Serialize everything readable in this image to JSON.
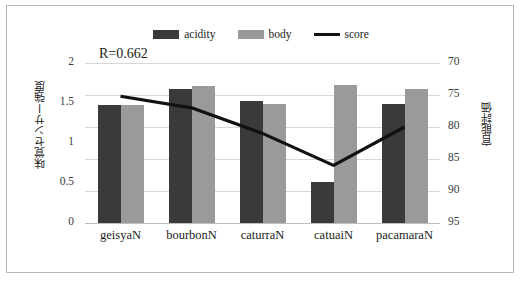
{
  "chart_data": {
    "type": "bar",
    "title": "",
    "categories": [
      "geisyaN",
      "bourbonN",
      "caturraN",
      "catuaiN",
      "pacamaraN"
    ],
    "series": [
      {
        "name": "acidity",
        "type": "bar",
        "axis": "left",
        "color": "#3a3a3a",
        "values": [
          1.48,
          1.67,
          1.53,
          0.51,
          1.49
        ]
      },
      {
        "name": "body",
        "type": "bar",
        "axis": "left",
        "color": "#9a9a9a",
        "values": [
          1.48,
          1.71,
          1.49,
          1.73,
          1.67
        ]
      },
      {
        "name": "score",
        "type": "line",
        "axis": "right",
        "color": "#111111",
        "values": [
          89.8,
          88.0,
          84.0,
          79.0,
          85.0
        ]
      }
    ],
    "xlabel": "",
    "ylabel": "味覚センサー強度",
    "y2label": "官能評価",
    "ylim": [
      0,
      2
    ],
    "y2lim": [
      70,
      95
    ],
    "yticks": [
      "0",
      "0.5",
      "1",
      "1.5",
      "2"
    ],
    "y2ticks": [
      "70",
      "75",
      "80",
      "85",
      "90",
      "95"
    ],
    "grid": true,
    "legend_position": "top-center",
    "annotations": [
      "R=0.662"
    ]
  },
  "legend": {
    "items": [
      {
        "label": "acidity",
        "swatch": "bar-dark"
      },
      {
        "label": "body",
        "swatch": "bar-gray"
      },
      {
        "label": "score",
        "swatch": "line-black"
      }
    ]
  },
  "annotation": {
    "correlation": "R=0.662"
  },
  "axes": {
    "left": {
      "title": "味覚センサー強度",
      "ticks": [
        "2",
        "1.5",
        "1",
        "0.5",
        "0"
      ]
    },
    "right": {
      "title": "官能評価",
      "ticks": [
        "95",
        "90",
        "85",
        "80",
        "75",
        "70"
      ]
    },
    "categories": [
      "geisyaN",
      "bourbonN",
      "caturraN",
      "catuaiN",
      "pacamaraN"
    ]
  }
}
